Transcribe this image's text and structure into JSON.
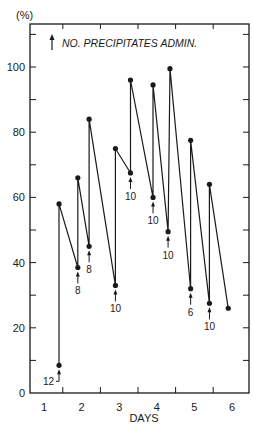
{
  "chart_data": {
    "type": "line",
    "title": "",
    "ylabel": "(%)",
    "xlabel": "DAYS",
    "legend": {
      "symbol": "up-arrow",
      "text": "NO. PRECIPITATES ADMIN.",
      "position": "top-left"
    },
    "xlim": [
      0.6,
      6.4
    ],
    "ylim": [
      0,
      112
    ],
    "x_ticks": [
      1,
      2,
      3,
      4,
      5,
      6
    ],
    "y_ticks": [
      0,
      20,
      40,
      60,
      80,
      100
    ],
    "grid": false,
    "series": [
      {
        "name": "value",
        "points": [
          {
            "x": 1.4,
            "y": 8.5
          },
          {
            "x": 1.4,
            "y": 58
          },
          {
            "x": 1.9,
            "y": 38.5
          },
          {
            "x": 1.9,
            "y": 66
          },
          {
            "x": 2.2,
            "y": 45
          },
          {
            "x": 2.2,
            "y": 84
          },
          {
            "x": 2.9,
            "y": 33
          },
          {
            "x": 2.9,
            "y": 75
          },
          {
            "x": 3.3,
            "y": 67.5
          },
          {
            "x": 3.3,
            "y": 96
          },
          {
            "x": 3.9,
            "y": 60
          },
          {
            "x": 3.9,
            "y": 94.5
          },
          {
            "x": 4.3,
            "y": 49.5
          },
          {
            "x": 4.35,
            "y": 99.5
          },
          {
            "x": 4.9,
            "y": 32
          },
          {
            "x": 4.9,
            "y": 77.5
          },
          {
            "x": 5.4,
            "y": 27.5
          },
          {
            "x": 5.4,
            "y": 64
          },
          {
            "x": 5.9,
            "y": 26
          }
        ]
      }
    ],
    "annotations": [
      {
        "x": 1.4,
        "y": 8.5,
        "label": "12",
        "style": "left"
      },
      {
        "x": 1.9,
        "y": 38.5,
        "label": "8"
      },
      {
        "x": 2.2,
        "y": 45,
        "label": "8"
      },
      {
        "x": 2.9,
        "y": 33,
        "label": "10"
      },
      {
        "x": 3.3,
        "y": 67.5,
        "label": "10"
      },
      {
        "x": 3.9,
        "y": 60,
        "label": "10"
      },
      {
        "x": 4.3,
        "y": 49.5,
        "label": "10"
      },
      {
        "x": 4.9,
        "y": 32,
        "label": "6"
      },
      {
        "x": 5.4,
        "y": 27.5,
        "label": "10"
      }
    ]
  },
  "labels": {
    "y_unit": "(%)",
    "x_title": "DAYS",
    "legend_text": "NO. PRECIPITATES ADMIN."
  }
}
